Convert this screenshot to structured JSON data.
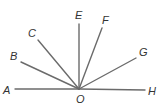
{
  "diagram": {
    "type": "rays-from-point",
    "vertex": {
      "label": "O",
      "x": 79,
      "y": 89,
      "label_x": 76,
      "label_y": 103
    },
    "colors": {
      "line": "#6b6b6b",
      "text": "#333333"
    },
    "rays": [
      {
        "label": "A",
        "x": 15,
        "y": 89,
        "label_x": 3,
        "label_y": 94
      },
      {
        "label": "B",
        "x": 21,
        "y": 62,
        "label_x": 10,
        "label_y": 60
      },
      {
        "label": "C",
        "x": 38,
        "y": 40,
        "label_x": 28,
        "label_y": 37
      },
      {
        "label": "E",
        "x": 79,
        "y": 24,
        "label_x": 75,
        "label_y": 19
      },
      {
        "label": "F",
        "x": 102,
        "y": 28,
        "label_x": 102,
        "label_y": 24
      },
      {
        "label": "G",
        "x": 136,
        "y": 58,
        "label_x": 139,
        "label_y": 56
      },
      {
        "label": "H",
        "x": 145,
        "y": 90,
        "label_x": 148,
        "label_y": 95
      }
    ]
  }
}
